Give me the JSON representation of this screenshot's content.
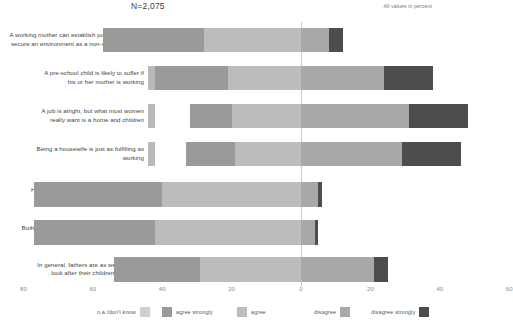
{
  "header": {
    "n_label": "N=2,075",
    "unit_note": "All values in percent"
  },
  "legend": {
    "items": [
      {
        "label": "n.a./don't know",
        "color": "#cfd0d0",
        "text_side": "left"
      },
      {
        "label": "agree strongly",
        "color": "#9a9a9a",
        "text_side": "right"
      },
      {
        "label": "agree",
        "color": "#bcbcbc",
        "text_side": "right"
      },
      {
        "label": "disagree",
        "color": "#a8a8a8",
        "text_side": "left"
      },
      {
        "label": "disagree strongly",
        "color": "#4d4d4d",
        "text_side": "left"
      }
    ]
  },
  "chart_data": {
    "type": "bar",
    "orientation": "horizontal",
    "stacking": "diverging",
    "title": "",
    "xlabel": "",
    "ylabel": "",
    "xlim": [
      -85,
      65
    ],
    "grid": false,
    "legend_position": "bottom",
    "xticks": [
      80,
      60,
      40,
      20,
      0,
      20,
      40,
      60
    ],
    "xtick_values": [
      -80,
      -60,
      -40,
      -20,
      0,
      20,
      40,
      60
    ],
    "series": [
      {
        "name": "n.a./don't know",
        "color": "#cfd0d0"
      },
      {
        "name": "agree strongly",
        "color": "#9a9a9a"
      },
      {
        "name": "agree",
        "color": "#bcbcbc"
      },
      {
        "name": "disagree",
        "color": "#a8a8a8"
      },
      {
        "name": "disagree strongly",
        "color": "#4d4d4d"
      }
    ],
    "categories": [
      "A working mother can establish just as warm and secure an environment as a non-working mother",
      "A pre-school child is likely to suffer if his or her mother is working",
      "A job is alright, but what most women really want is a home and children",
      "Being a housewife is just as fulfilling as working",
      "Having a job is the best way for a woman to be independent",
      "Both the husband and wife should contribute to the family income",
      "In general, fathers are as well suited to look after their children as women"
    ],
    "rows": [
      {
        "category": "A working mother can establish just as warm and secure an environment as a non-working mother",
        "label_lines": [
          "A working mother can establish just as warm and",
          "secure an environment as a non-working mother"
        ],
        "agree_strongly": 29,
        "agree": 28,
        "disagree": 8,
        "disagree_strongly": 4
      },
      {
        "category": "A pre-school child is likely to suffer if his or her mother is working",
        "label_lines": [
          "A pre-school child is likely to suffer if",
          "his or her mother is working"
        ],
        "agree_strongly": 21,
        "agree": 21,
        "disagree": 24,
        "disagree_strongly": 14
      },
      {
        "category": "A job is alright, but what most women really want is a home and children",
        "label_lines": [
          "A job is alright, but what most women",
          "really want is a home and children"
        ],
        "agree_strongly": 12,
        "agree": 20,
        "disagree": 31,
        "disagree_strongly": 17
      },
      {
        "category": "Being a housewife is just as fulfilling as working",
        "label_lines": [
          "Being a housewife is just as fulfilling as",
          "working"
        ],
        "agree_strongly": 14,
        "agree": 19,
        "disagree": 29,
        "disagree_strongly": 17
      },
      {
        "category": "Having a job is the best way for a woman to be independent",
        "label_lines": [
          "Having a job is the best way for a woman",
          "to be independent"
        ],
        "agree_strongly": 37,
        "agree": 40,
        "disagree": 5,
        "disagree_strongly": 1
      },
      {
        "category": "Both the husband and wife should contribute to the family income",
        "label_lines": [
          "Both the husband and wife should contribute",
          "to the family income"
        ],
        "agree_strongly": 35,
        "agree": 42,
        "disagree": 4,
        "disagree_strongly": 1
      },
      {
        "category": "In general, fathers are as well suited to look after their children as women",
        "label_lines": [
          "In general, fathers are as well suited to",
          "look after their children as women"
        ],
        "agree_strongly": 25,
        "agree": 29,
        "disagree": 21,
        "disagree_strongly": 4
      }
    ]
  }
}
